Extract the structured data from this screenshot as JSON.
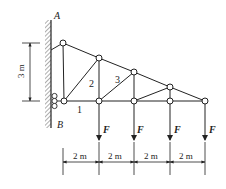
{
  "diagram": {
    "type": "truss",
    "supports": {
      "A": {
        "label": "A",
        "type": "pin-wall"
      },
      "B": {
        "label": "B",
        "type": "roller-wall"
      }
    },
    "member_labels": [
      "1",
      "2",
      "3"
    ],
    "loads": [
      {
        "label": "F"
      },
      {
        "label": "F"
      },
      {
        "label": "F"
      },
      {
        "label": "F"
      }
    ],
    "dimensions": {
      "vertical": "3 m",
      "horizontal": [
        "2 m",
        "2 m",
        "2 m",
        "2 m"
      ]
    },
    "colors": {
      "line": "#222222",
      "background": "#ffffff"
    }
  }
}
